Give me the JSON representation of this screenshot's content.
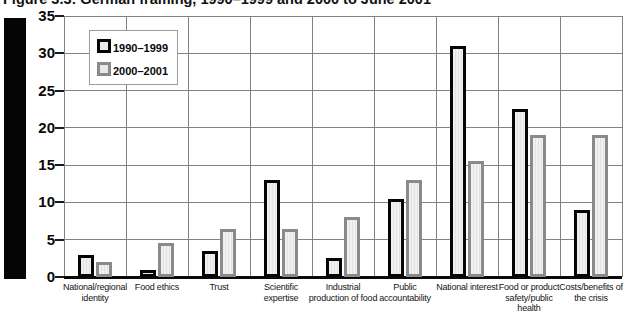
{
  "title": "Figure 3.3: German framing, 1990–1999 and 2000 to June 2001",
  "colors": {
    "background": "#ffffff",
    "series_1990_1999_border": "#050505",
    "series_2000_2001_border": "#8a8a8a",
    "bar_fill": "#ececec",
    "gridline": "#828282",
    "axis": "#0a0a0a",
    "left_band": "#050505"
  },
  "chart_data": {
    "type": "bar",
    "title": "Figure 3.3: German framing, 1990–1999 and 2000 to June 2001",
    "categories": [
      "National/regional identity",
      "Food ethics",
      "Trust",
      "Scientific expertise",
      "Industrial production of food",
      "Public accountability",
      "National interest",
      "Food or product safety/public health",
      "Costs/benefits of the crisis"
    ],
    "series": [
      {
        "name": "1990–1999",
        "values": [
          3,
          1,
          3.5,
          13,
          2.5,
          10.5,
          31,
          22.5,
          9
        ]
      },
      {
        "name": "2000–2001",
        "values": [
          2,
          4.5,
          6.5,
          6.5,
          8,
          13,
          15.5,
          19,
          19
        ]
      }
    ],
    "xlabel": "",
    "ylabel": "",
    "ylim": [
      0,
      35
    ],
    "y_ticks": [
      0,
      5,
      10,
      15,
      20,
      25,
      30,
      35
    ],
    "grid": true,
    "legend_position": "top-left"
  }
}
